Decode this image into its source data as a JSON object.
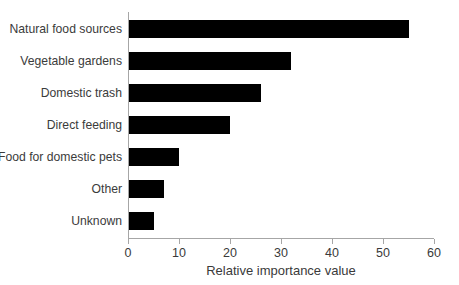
{
  "chart_data": {
    "type": "bar",
    "orientation": "horizontal",
    "title": "",
    "subtitle": "",
    "xlabel": "Relative importance value",
    "ylabel": "",
    "categories": [
      "Natural food sources",
      "Vegetable gardens",
      "Domestic trash",
      "Direct feeding",
      "Food for domestic pets",
      "Other",
      "Unknown"
    ],
    "values": [
      55,
      32,
      26,
      20,
      10,
      7,
      5
    ],
    "xlim": [
      0,
      60
    ],
    "xticks": [
      0,
      10,
      20,
      30,
      40,
      50,
      60
    ],
    "xtick_labels": [
      "0",
      "10",
      "20",
      "30",
      "40",
      "50",
      "60"
    ],
    "grid": false,
    "legend": false,
    "bar_color": "#000000",
    "axis_color": "#a6a6a6",
    "text_color": "#3a3a3a",
    "background_color": "#ffffff"
  }
}
